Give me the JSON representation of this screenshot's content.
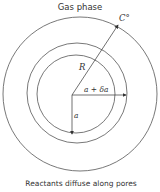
{
  "diagram": {
    "title": "Gas phase",
    "caption": "Reactants diffuse along pores",
    "labels": {
      "surface_concentration": "C°",
      "outer_radius": "R",
      "shell_radius": "a + δa",
      "inner_radius": "a"
    },
    "circles": [
      {
        "name": "particle-surface",
        "cx": 80,
        "cy": 94,
        "r": 77
      },
      {
        "name": "shell-outer",
        "cx": 78,
        "cy": 94,
        "r": 51
      },
      {
        "name": "shell-inner",
        "cx": 77,
        "cy": 94,
        "r": 40
      }
    ],
    "colors": {
      "stroke": "#555555",
      "text": "#333333"
    }
  }
}
